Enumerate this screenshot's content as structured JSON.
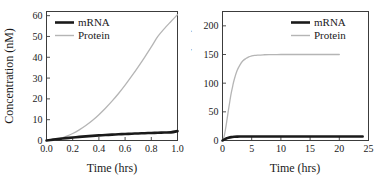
{
  "figure": {
    "background": "#ffffff",
    "panel_count": 2
  },
  "colors": {
    "mrna": "#1a1a1a",
    "protein": "#b5b5b5",
    "axis": "#3c3c3c",
    "text": "#1a1a1a"
  },
  "chart_data": [
    {
      "type": "line",
      "title": "",
      "xlabel": "Time (hrs)",
      "ylabel": "Concentration (nM)",
      "xlim": [
        0,
        1.0
      ],
      "ylim": [
        0,
        62
      ],
      "xticks": [
        "0.0",
        "0.2",
        "0.4",
        "0.6",
        "0.8",
        "1.0"
      ],
      "xtick_values": [
        0.0,
        0.2,
        0.4,
        0.6,
        0.8,
        1.0
      ],
      "yticks": [
        "0",
        "10",
        "20",
        "30",
        "40",
        "50",
        "60"
      ],
      "ytick_values": [
        0,
        10,
        20,
        30,
        40,
        50,
        60
      ],
      "grid": false,
      "legend_position": "upper-left",
      "legend": [
        "mRNA",
        "Protein"
      ],
      "series": [
        {
          "name": "mRNA",
          "color": "#1a1a1a",
          "width": 2.6,
          "x": [
            0.0,
            0.05,
            0.1,
            0.15,
            0.2,
            0.25,
            0.3,
            0.35,
            0.4,
            0.45,
            0.5,
            0.55,
            0.6,
            0.65,
            0.7,
            0.75,
            0.8,
            0.85,
            0.9,
            0.95,
            1.0
          ],
          "values": [
            0.0,
            0.42,
            0.8,
            1.14,
            1.45,
            1.73,
            1.99,
            2.22,
            2.44,
            2.63,
            2.81,
            2.98,
            3.13,
            3.27,
            3.4,
            3.52,
            3.63,
            3.74,
            3.83,
            3.92,
            4.5
          ]
        },
        {
          "name": "Protein",
          "color": "#b5b5b5",
          "width": 1.3,
          "x": [
            0.0,
            0.05,
            0.1,
            0.15,
            0.2,
            0.25,
            0.3,
            0.35,
            0.4,
            0.45,
            0.5,
            0.55,
            0.6,
            0.65,
            0.7,
            0.75,
            0.8,
            0.85,
            0.9,
            0.95,
            1.0
          ],
          "values": [
            0.0,
            0.25,
            0.9,
            1.95,
            3.35,
            5.1,
            7.2,
            9.6,
            12.4,
            15.5,
            18.9,
            22.6,
            26.6,
            30.9,
            35.4,
            40.1,
            45.0,
            50.0,
            53.8,
            57.2,
            60.5
          ]
        }
      ]
    },
    {
      "type": "line",
      "title": "",
      "xlabel": "Time (hrs)",
      "ylabel": "Concentration (nM)",
      "xlim": [
        0,
        25
      ],
      "ylim": [
        0,
        225
      ],
      "xticks": [
        "0",
        "5",
        "10",
        "15",
        "20",
        "25"
      ],
      "xtick_values": [
        0,
        5,
        10,
        15,
        20,
        25
      ],
      "yticks": [
        "0",
        "50",
        "100",
        "150",
        "200"
      ],
      "ytick_values": [
        0,
        50,
        100,
        150,
        200
      ],
      "grid": false,
      "legend_position": "upper-right",
      "legend": [
        "mRNA",
        "Protein"
      ],
      "series": [
        {
          "name": "mRNA",
          "color": "#1a1a1a",
          "width": 2.6,
          "x": [
            0,
            0.25,
            0.5,
            0.75,
            1,
            1.5,
            2,
            2.5,
            3,
            4,
            5,
            6,
            8,
            10,
            12,
            14,
            16,
            18,
            20,
            22,
            24
          ],
          "values": [
            0,
            1.6,
            2.9,
            4.0,
            4.8,
            5.9,
            6.5,
            6.8,
            6.95,
            7.05,
            7.08,
            7.1,
            7.1,
            7.1,
            7.1,
            7.1,
            7.1,
            7.1,
            7.1,
            7.1,
            7.1
          ]
        },
        {
          "name": "Protein",
          "color": "#b5b5b5",
          "width": 1.3,
          "x": [
            0,
            0.25,
            0.5,
            0.75,
            1,
            1.25,
            1.5,
            1.75,
            2,
            2.5,
            3,
            3.5,
            4,
            4.5,
            5,
            5.5,
            6,
            7,
            8,
            10,
            12,
            14,
            16,
            18,
            20,
            22,
            24
          ],
          "values": [
            0,
            6,
            19,
            35,
            52,
            68,
            83,
            95,
            106,
            122,
            132,
            139,
            143,
            146,
            147.5,
            148.5,
            149,
            149.5,
            149.8,
            150,
            150,
            150,
            150,
            150,
            150,
            150
          ]
        }
      ]
    }
  ],
  "panels": [
    {
      "id": "panel-left",
      "xlabel": "Time (hrs)",
      "ylabel": "Concentration (nM)",
      "legend": [
        {
          "label": "mRNA",
          "style": "thick-black"
        },
        {
          "label": "Protein",
          "style": "thin-gray"
        }
      ]
    },
    {
      "id": "panel-right",
      "xlabel": "Time (hrs)",
      "ylabel": "Concentration (nM)",
      "legend": [
        {
          "label": "mRNA",
          "style": "thick-black"
        },
        {
          "label": "Protein",
          "style": "thin-gray"
        }
      ]
    }
  ]
}
